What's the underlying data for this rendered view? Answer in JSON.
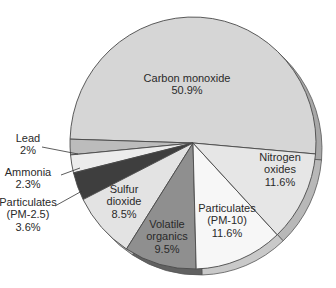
{
  "chart_data": {
    "type": "pie",
    "title": "",
    "start_angle_deg": 0,
    "direction": "counterclockwise-from-east-for-CO",
    "slices": [
      {
        "name": "Carbon monoxide",
        "label_lines": [
          "Carbon monoxide"
        ],
        "value": 50.9,
        "value_label": "50.9%",
        "color": "#d6d6d6"
      },
      {
        "name": "Lead",
        "label_lines": [
          "Lead"
        ],
        "value": 2,
        "value_label": "2%",
        "color": "#bcbcbc"
      },
      {
        "name": "Ammonia",
        "label_lines": [
          "Ammonia"
        ],
        "value": 2.3,
        "value_label": "2.3%",
        "color": "#ececec"
      },
      {
        "name": "Particulates (PM-2.5)",
        "label_lines": [
          "Particulates",
          "(PM-2.5)"
        ],
        "value": 3.6,
        "value_label": "3.6%",
        "color": "#3e3e3e"
      },
      {
        "name": "Sulfur dioxide",
        "label_lines": [
          "Sulfur",
          "dioxide"
        ],
        "value": 8.5,
        "value_label": "8.5%",
        "color": "#e3e3e3"
      },
      {
        "name": "Volatile organics",
        "label_lines": [
          "Volatile",
          "organics"
        ],
        "value": 9.5,
        "value_label": "9.5%",
        "color": "#8f8f8f"
      },
      {
        "name": "Particulates (PM-10)",
        "label_lines": [
          "Particulates",
          "(PM-10)"
        ],
        "value": 11.6,
        "value_label": "11.6%",
        "color": "#f7f7f7"
      },
      {
        "name": "Nitrogen oxides",
        "label_lines": [
          "Nitrogen",
          "oxides"
        ],
        "value": 11.6,
        "value_label": "11.6%",
        "color": "#e6e6e6"
      }
    ],
    "legend": "none",
    "labels": "inside-or-callout"
  }
}
